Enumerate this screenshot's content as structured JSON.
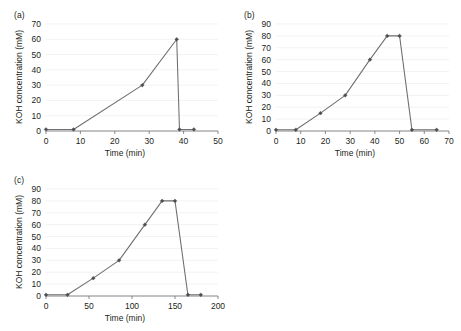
{
  "figure": {
    "background": "#ffffff",
    "line_color": "#6d6e71",
    "marker_color": "#4d4d4f",
    "grid_color": "#ededed",
    "text_color": "#231f20"
  },
  "panels": [
    {
      "id": "a",
      "label": "(a)",
      "chart_data": {
        "type": "line",
        "title": "",
        "xlabel": "Time (min)",
        "ylabel": "KOH concentration (mM)",
        "xlim": [
          0,
          50
        ],
        "ylim": [
          0,
          70
        ],
        "xticks": [
          0,
          10,
          20,
          30,
          40,
          50
        ],
        "yticks": [
          0,
          10,
          20,
          30,
          40,
          50,
          60,
          70
        ],
        "xtick_labels": [
          "0",
          "10",
          "20",
          "30",
          "40",
          "50"
        ],
        "ytick_labels": [
          "0",
          "10",
          "20",
          "30",
          "40",
          "50",
          "60",
          "70"
        ],
        "grid": true,
        "legend": false,
        "markers": "diamond",
        "series": [
          {
            "name": "KOH gradient",
            "x": [
              0,
              8,
              28,
              38,
              38.8,
              43
            ],
            "y": [
              1,
              1,
              30,
              60,
              1,
              1
            ]
          }
        ]
      }
    },
    {
      "id": "b",
      "label": "(b)",
      "chart_data": {
        "type": "line",
        "title": "",
        "xlabel": "Time (min)",
        "ylabel": "KOH concentration (mM)",
        "xlim": [
          0,
          70
        ],
        "ylim": [
          0,
          90
        ],
        "xticks": [
          0,
          10,
          20,
          30,
          40,
          50,
          60,
          70
        ],
        "yticks": [
          0,
          10,
          20,
          30,
          40,
          50,
          60,
          70,
          80,
          90
        ],
        "xtick_labels": [
          "0",
          "10",
          "20",
          "30",
          "40",
          "50",
          "60",
          "70"
        ],
        "ytick_labels": [
          "0",
          "10",
          "20",
          "30",
          "40",
          "50",
          "60",
          "70",
          "80",
          "90"
        ],
        "grid": true,
        "legend": false,
        "markers": "diamond",
        "series": [
          {
            "name": "KOH gradient",
            "x": [
              0,
              8,
              18,
              28,
              38,
              45,
              50,
              55,
              65
            ],
            "y": [
              1,
              1,
              15,
              30,
              60,
              80,
              80,
              1,
              1
            ]
          }
        ]
      }
    },
    {
      "id": "c",
      "label": "(c)",
      "chart_data": {
        "type": "line",
        "title": "",
        "xlabel": "Time (min)",
        "ylabel": "KOH concentration (mM)",
        "xlim": [
          0,
          200
        ],
        "ylim": [
          0,
          90
        ],
        "xticks": [
          0,
          50,
          100,
          150,
          200
        ],
        "yticks": [
          0,
          10,
          20,
          30,
          40,
          50,
          60,
          70,
          80,
          90
        ],
        "xtick_labels": [
          "0",
          "50",
          "100",
          "150",
          "200"
        ],
        "ytick_labels": [
          "0",
          "10",
          "20",
          "30",
          "40",
          "50",
          "60",
          "70",
          "80",
          "90"
        ],
        "grid": true,
        "legend": false,
        "markers": "diamond",
        "series": [
          {
            "name": "KOH gradient",
            "x": [
              0,
              25,
              55,
              85,
              115,
              135,
              150,
              165,
              180
            ],
            "y": [
              1,
              1,
              15,
              30,
              60,
              80,
              80,
              1,
              1
            ]
          }
        ]
      }
    }
  ]
}
